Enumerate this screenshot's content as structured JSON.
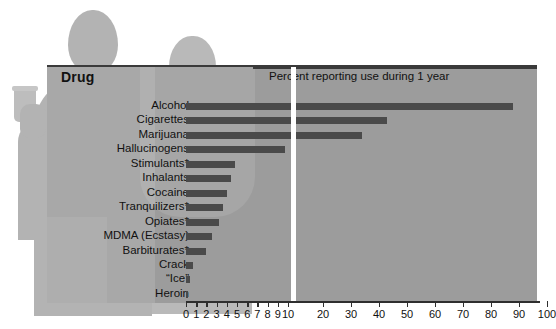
{
  "figure": {
    "background_color": "#ffffff",
    "panel_color": "#9c9c9c",
    "bar_color": "#4a4a4a",
    "silhouette_color": "#b3b3b3"
  },
  "header": {
    "drug_column_label": "Drug",
    "chart_title": "Percent reporting use during 1 year"
  },
  "chart_data": {
    "type": "bar",
    "orientation": "horizontal",
    "title": "Percent reporting use during 1 year",
    "xlabel": "",
    "ylabel": "Drug",
    "xlim": [
      0,
      100
    ],
    "grid": false,
    "legend": false,
    "broken_axis": {
      "present": true,
      "break_after": 10,
      "note": "0-10 expanded linear scale, 10-100 compressed scale"
    },
    "categories": [
      "Alcohol",
      "Cigarettes",
      "Marijuana",
      "Hallucinogens",
      "Stimulants*",
      "Inhalants",
      "Cocaine",
      "Tranquilizers*",
      "Opiates*",
      "MDMA (Ecstasy)",
      "Barbiturates*",
      "Crack",
      "“Ice”",
      "Heroin"
    ],
    "values": [
      88,
      43,
      34,
      9.7,
      4.8,
      4.4,
      4.0,
      3.6,
      3.2,
      2.5,
      2.0,
      0.7,
      0.4,
      0.2
    ],
    "tick_values": [
      0,
      1,
      2,
      3,
      4,
      5,
      6,
      7,
      8,
      9,
      10,
      20,
      30,
      40,
      50,
      60,
      70,
      80,
      90,
      100
    ],
    "tick_labels": [
      "0",
      "1",
      "2",
      "3",
      "4",
      "5",
      "6",
      "7",
      "8",
      "9",
      "10",
      "20",
      "30",
      "40",
      "50",
      "60",
      "70",
      "80",
      "90",
      "100"
    ]
  }
}
